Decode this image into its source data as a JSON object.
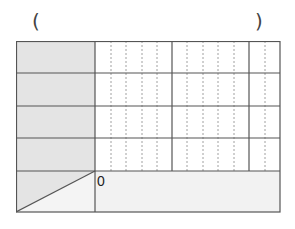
{
  "header": {
    "left_paren": "(",
    "right_paren": ")"
  },
  "table": {
    "rows": 5,
    "label_rows": 4,
    "major_columns": 3,
    "minor_divisions_per_major": 5,
    "origin_label": "0"
  },
  "colors": {
    "label_fill": "#e4e4e4",
    "bottom_fill": "#f2f2f2",
    "grid_line": "#555555",
    "dashed_line": "#999999"
  }
}
